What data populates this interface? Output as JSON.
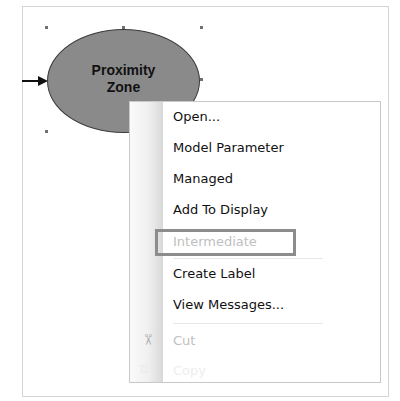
{
  "model_element": {
    "label_line1": "Proximity",
    "label_line2": "Zone",
    "fill_color": "#8a8a8a",
    "state": "selected"
  },
  "context_menu": {
    "items": [
      {
        "label": "Open...",
        "enabled": true
      },
      {
        "label": "Model Parameter",
        "enabled": true
      },
      {
        "label": "Managed",
        "enabled": true
      },
      {
        "label": "Add To Display",
        "enabled": true
      },
      {
        "label": "Intermediate",
        "enabled": false,
        "highlighted": true
      },
      {
        "label": "Create Label",
        "enabled": true
      },
      {
        "label": "View Messages...",
        "enabled": true
      },
      {
        "label": "Cut",
        "enabled": false,
        "icon": "scissors-icon"
      },
      {
        "label": "Copy",
        "enabled": false,
        "icon": "copy-icon"
      }
    ],
    "icons": {
      "scissors": "✂",
      "copy": "⧉"
    },
    "highlight_color": "#8c8c8c"
  }
}
